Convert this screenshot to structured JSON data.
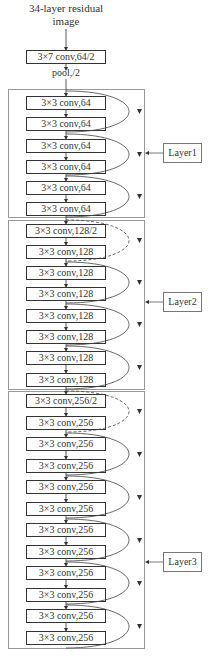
{
  "diagram": {
    "title": "34-layer residual image",
    "title_lines": [
      "34-layer residual",
      "image"
    ],
    "stem": {
      "conv": "3×7 conv,64/2",
      "pool": "pool,/2"
    },
    "layers": [
      {
        "name": "Layer1",
        "blocks": [
          "3×3 conv,64",
          "3×3 conv,64",
          "3×3 conv,64",
          "3×3 conv,64",
          "3×3 conv,64",
          "3×3 conv,64"
        ],
        "shortcut_styles": [
          "solid",
          "solid",
          "solid"
        ]
      },
      {
        "name": "Layer2",
        "blocks": [
          "3×3 conv,128/2",
          "3×3 conv,128",
          "3×3 conv,128",
          "3×3 conv,128",
          "3×3 conv,128",
          "3×3 conv,128",
          "3×3 conv,128",
          "3×3 conv,128"
        ],
        "shortcut_styles": [
          "dashed",
          "solid",
          "solid",
          "solid"
        ]
      },
      {
        "name": "Layer3",
        "blocks": [
          "3×3 conv,256/2",
          "3×3 conv,256",
          "3×3 conv,256",
          "3×3 conv,256",
          "3×3 conv,256",
          "3×3 conv,256",
          "3×3 conv,256",
          "3×3 conv,256",
          "3×3 conv,256",
          "3×3 conv,256",
          "3×3 conv,256",
          "3×3 conv,256"
        ],
        "shortcut_styles": [
          "dashed",
          "solid",
          "solid",
          "solid",
          "solid",
          "solid"
        ]
      }
    ],
    "colors": {
      "line": "#333333",
      "frame": "#999999",
      "background": "#ffffff"
    }
  }
}
